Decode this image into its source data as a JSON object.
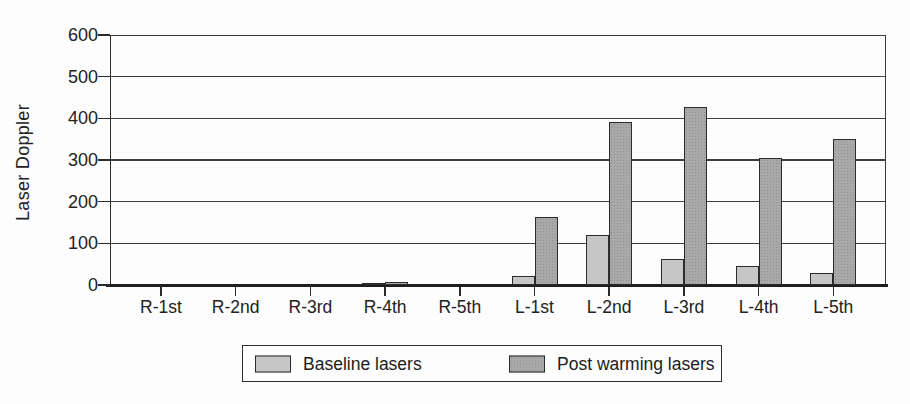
{
  "chart_data": {
    "type": "bar",
    "title": "",
    "xlabel": "",
    "ylabel": "Laser Doppler",
    "ylim": [
      0,
      600
    ],
    "yticks": [
      0,
      100,
      200,
      300,
      400,
      500,
      600
    ],
    "grid": true,
    "legend_position": "bottom",
    "categories": [
      "R-1st",
      "R-2nd",
      "R-3rd",
      "R-4th",
      "R-5th",
      "L-1st",
      "L-2nd",
      "L-3rd",
      "L-4th",
      "L-5th"
    ],
    "series": [
      {
        "name": "Baseline lasers",
        "color": "#c6c6c6",
        "values": [
          0,
          0,
          0,
          5,
          0,
          22,
          120,
          62,
          46,
          28
        ]
      },
      {
        "name": "Post warming lasers",
        "color": "#a9a9a9",
        "values": [
          0,
          0,
          0,
          7,
          0,
          163,
          390,
          427,
          305,
          350
        ]
      }
    ]
  },
  "colors": {
    "background": "#fdfdfd",
    "axis": "#2b2b2b",
    "grid": "#3f3f3f",
    "text": "#1c1c1c",
    "bar_border": "#2b2b2b"
  }
}
